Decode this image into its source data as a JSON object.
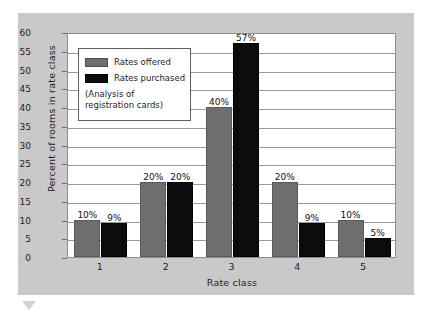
{
  "chart_data": {
    "type": "bar",
    "title": "",
    "xlabel": "Rate class",
    "ylabel": "Percent of rooms in rate class",
    "categories": [
      "1",
      "2",
      "3",
      "4",
      "5"
    ],
    "series": [
      {
        "name": "Rates offered",
        "color": "#6e6e6e",
        "values": [
          10,
          20,
          40,
          20,
          10
        ],
        "labels": [
          "10%",
          "20%",
          "40%",
          "20%",
          "10%"
        ]
      },
      {
        "name": "Rates purchased",
        "color": "#0c0c0c",
        "values": [
          9,
          20,
          57,
          9,
          5
        ],
        "labels": [
          "9%",
          "20%",
          "57%",
          "9%",
          "5%"
        ]
      }
    ],
    "ylim": [
      0,
      60
    ],
    "yticks": [
      0,
      5,
      10,
      15,
      20,
      25,
      30,
      35,
      40,
      45,
      50,
      55,
      60
    ],
    "ytick_labels": [
      "0",
      "5",
      "10",
      "15",
      "20",
      "25",
      "30",
      "35",
      "40",
      "45",
      "50",
      "55",
      "60"
    ],
    "grid": "horizontal",
    "legend_position": "upper-left",
    "annotation_lines": [
      "(Analysis of",
      "registration cards)"
    ]
  },
  "legend": {
    "items": [
      {
        "label": "Rates offered",
        "swatch": "offered"
      },
      {
        "label": "Rates purchased",
        "swatch": "purchased"
      }
    ],
    "note_line_1": "(Analysis of",
    "note_line_2": "registration cards)"
  },
  "colors": {
    "panel_background": "#c9c9c9",
    "plot_background": "#ffffff",
    "gridline": "#9a9a9a",
    "axis": "#8f8f8f",
    "series_offered": "#6e6e6e",
    "series_purchased": "#0c0c0c",
    "text": "#1d1d1d"
  }
}
